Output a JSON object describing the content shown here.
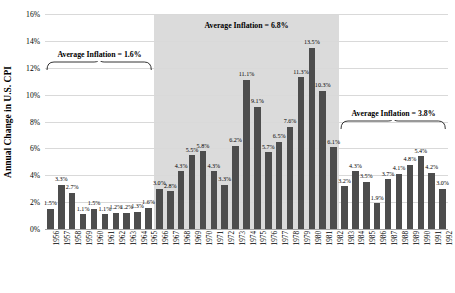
{
  "chart_data": {
    "type": "bar",
    "title": "",
    "xlabel": "",
    "ylabel": "Annual Change in U.S. CPI",
    "ylim": [
      0,
      16
    ],
    "ytick_labels": [
      "0%",
      "2%",
      "4%",
      "6%",
      "8%",
      "10%",
      "12%",
      "14%",
      "16%"
    ],
    "ytick_values": [
      0,
      2,
      4,
      6,
      8,
      10,
      12,
      14,
      16
    ],
    "grid": true,
    "legend": "none",
    "bar_color": "#4d4d4d",
    "shaded_band_color": "#d5d5d5",
    "categories": [
      "1956",
      "1957",
      "1958",
      "1959",
      "1960",
      "1961",
      "1962",
      "1963",
      "1964",
      "1965",
      "1966",
      "1967",
      "1968",
      "1969",
      "1970",
      "1971",
      "1972",
      "1973",
      "1974",
      "1975",
      "1976",
      "1977",
      "1978",
      "1979",
      "1980",
      "1981",
      "1982",
      "1983",
      "1984",
      "1985",
      "1986",
      "1987",
      "1988",
      "1989",
      "1990",
      "1991",
      "1992"
    ],
    "values": [
      1.5,
      3.3,
      2.7,
      1.1,
      1.5,
      1.1,
      1.2,
      1.2,
      1.3,
      1.6,
      3.0,
      2.8,
      4.3,
      5.5,
      5.8,
      4.3,
      3.3,
      6.2,
      11.1,
      9.1,
      5.7,
      6.5,
      7.6,
      11.3,
      13.5,
      10.3,
      6.1,
      3.2,
      4.3,
      3.5,
      1.9,
      3.7,
      4.1,
      4.8,
      5.4,
      4.2,
      3.0
    ],
    "data_labels": [
      "1.5%",
      "3.3%",
      "2.7%",
      "1.1%",
      "1.5%",
      "1.1%",
      "1.2%",
      "1.2%",
      "1.3%",
      "1.6%",
      "3.0%",
      "2.8%",
      "4.3%",
      "5.5%",
      "5.8%",
      "4.3%",
      "3.3%",
      "6.2%",
      "11.1%",
      "9.1%",
      "5.7%",
      "6.5%",
      "7.6%",
      "11.3%",
      "13.5%",
      "10.3%",
      "6.1%",
      "3.2%",
      "4.3%",
      "3.5%",
      "1.9%",
      "3.7%",
      "4.1%",
      "4.8%",
      "5.4%",
      "4.2%",
      "3.0%"
    ],
    "shaded_region": {
      "start_category": "1966",
      "end_category": "1982"
    },
    "annotations": [
      {
        "label": "Average Inflation = 1.6%",
        "start_category": "1956",
        "end_category": "1965",
        "value": 1.6
      },
      {
        "label": "Average Inflation = 6.8%",
        "start_category": "1966",
        "end_category": "1982",
        "value": 6.8
      },
      {
        "label": "Average Inflation = 3.8%",
        "start_category": "1983",
        "end_category": "1992",
        "value": 3.8
      }
    ]
  }
}
